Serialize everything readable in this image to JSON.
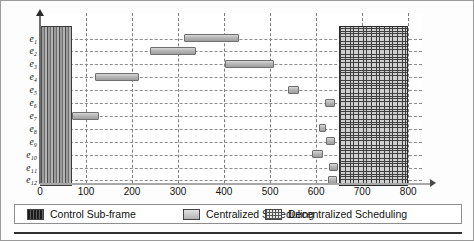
{
  "chart_data": {
    "type": "bar",
    "chart_subtype": "gantt-timeline",
    "title": "",
    "xlabel": "",
    "ylabel": "",
    "xlim": [
      0,
      830
    ],
    "ylim_categories": [
      "e1",
      "e2",
      "e3",
      "e4",
      "e5",
      "e6",
      "e7",
      "e8",
      "e9",
      "e10",
      "e11",
      "e12"
    ],
    "x_ticks": [
      0,
      100,
      200,
      300,
      400,
      500,
      600,
      700,
      800
    ],
    "x_tick_labels": [
      "0",
      "100",
      "200",
      "300",
      "400",
      "500",
      "600",
      "700",
      "800"
    ],
    "y_tick_labels": [
      "e₁",
      "e₂",
      "e₃",
      "e₄",
      "e₅",
      "e₆",
      "e₇",
      "e₈",
      "e₉",
      "e₁₀",
      "e₁₁",
      "e₁₂"
    ],
    "grid": "dashed both axes",
    "legend_position": "below axes",
    "series": [
      {
        "name": "Control Sub-frame",
        "style": "vertical-striped-dark",
        "color": "#4d4d4d",
        "spans": [
          {
            "label": "control-sub-frame",
            "start": 0,
            "end": 70,
            "rows": [
              "e1",
              "e12"
            ]
          }
        ]
      },
      {
        "name": "Centralized Scheduling",
        "style": "light-gray-gradient",
        "color": "#b6b6b6",
        "bars": [
          {
            "row": "e1",
            "start": 312,
            "end": 432
          },
          {
            "row": "e2",
            "start": 240,
            "end": 340
          },
          {
            "row": "e3",
            "start": 402,
            "end": 508
          },
          {
            "row": "e4",
            "start": 120,
            "end": 215
          },
          {
            "row": "e5",
            "start": 538,
            "end": 562
          },
          {
            "row": "e6",
            "start": 620,
            "end": 642
          },
          {
            "row": "e7",
            "start": 70,
            "end": 128
          },
          {
            "row": "e8",
            "start": 606,
            "end": 622
          },
          {
            "row": "e9",
            "start": 622,
            "end": 642
          },
          {
            "row": "e10",
            "start": 592,
            "end": 615
          },
          {
            "row": "e11",
            "start": 628,
            "end": 648
          },
          {
            "row": "e12",
            "start": 626,
            "end": 646
          }
        ]
      },
      {
        "name": "Decentralized Scheduling",
        "style": "cross-hatch-grid",
        "color": "#cfcfcf",
        "spans": [
          {
            "label": "decentralized-scheduling",
            "start": 650,
            "end": 800,
            "rows": [
              "e1",
              "e12"
            ]
          }
        ]
      }
    ]
  },
  "legend": {
    "items": [
      {
        "label": "Control Sub-frame",
        "swatch": "control-swatch"
      },
      {
        "label": "Centralized Scheduling",
        "swatch": "centralized-swatch"
      },
      {
        "label": "Decentralized Scheduling",
        "swatch": "decentralized-swatch"
      }
    ]
  },
  "axis": {
    "x_ticks": [
      "0",
      "100",
      "200",
      "300",
      "400",
      "500",
      "600",
      "700",
      "800"
    ],
    "y_ticks": [
      "e₁",
      "e₂",
      "e₃",
      "e₄",
      "e₅",
      "e₆",
      "e₇",
      "e₈",
      "e₉",
      "e₁₀",
      "e₁₁",
      "e₁₂"
    ]
  }
}
